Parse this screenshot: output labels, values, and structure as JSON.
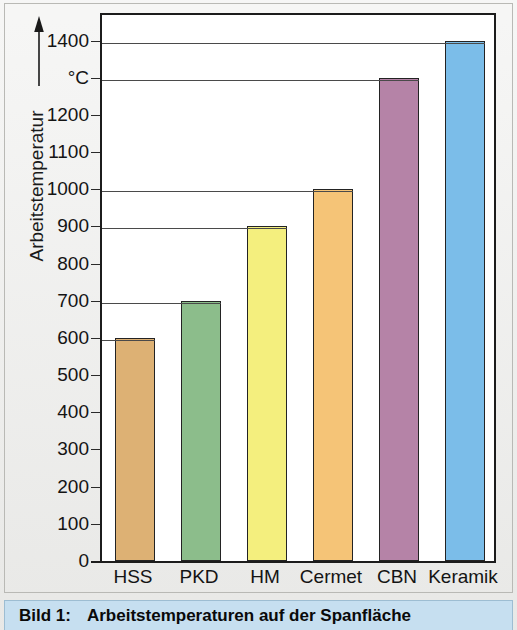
{
  "chart_data": {
    "type": "bar",
    "title": "Arbeitstemperaturen auf der Spanfläche",
    "categories": [
      "HSS",
      "PKD",
      "HM",
      "Cermet",
      "CBN",
      "Keramik"
    ],
    "values": [
      600,
      700,
      900,
      1000,
      1300,
      1400
    ],
    "xlabel": "",
    "ylabel": "Arbeitstemperatur",
    "yunit": "°C",
    "ylim": [
      0,
      1450
    ],
    "ytick_labels": [
      "0",
      "100",
      "200",
      "300",
      "400",
      "500",
      "600",
      "700",
      "800",
      "900",
      "1000",
      "1100",
      "1200",
      "°C",
      "1400"
    ],
    "ytick_values": [
      0,
      100,
      200,
      300,
      400,
      500,
      600,
      700,
      800,
      900,
      1000,
      1100,
      1200,
      1300,
      1400
    ],
    "gridline_values": [
      600,
      700,
      900,
      1000,
      1300,
      1400
    ],
    "grid": "partial",
    "legend": "none",
    "bar_colors": [
      "#ddb174",
      "#8cbd8b",
      "#f4ef7e",
      "#f5c477",
      "#b583a7",
      "#7bbde9"
    ],
    "bar_edge_color": "#232323"
  },
  "caption": {
    "label": "Bild 1:",
    "text": "Arbeitstemperaturen auf der Spanfläche"
  },
  "axis": {
    "y_title": "Arbeitstemperatur",
    "arrow": "up-arrow"
  }
}
